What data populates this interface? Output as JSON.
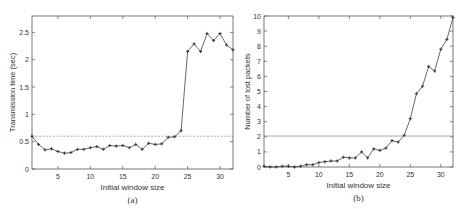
{
  "chart_data": [
    {
      "type": "line",
      "panel_label": "(a)",
      "xlabel": "Initial window size",
      "ylabel": "Transmission time (sec)",
      "xlim": [
        1,
        32
      ],
      "ylim": [
        0,
        2.8
      ],
      "xticks": [
        5,
        10,
        15,
        20,
        25,
        30
      ],
      "yticks": [
        0,
        0.5,
        1,
        1.5,
        2,
        2.5
      ],
      "ytick_labels": [
        "0",
        "0.5",
        "1",
        "1.5",
        "2",
        "2.5"
      ],
      "grid": false,
      "reference_line": {
        "y": 0.6,
        "style": "dashed"
      },
      "x": [
        1,
        2,
        3,
        4,
        5,
        6,
        7,
        8,
        9,
        10,
        11,
        12,
        13,
        14,
        15,
        16,
        17,
        18,
        19,
        20,
        21,
        22,
        23,
        24,
        25,
        26,
        27,
        28,
        29,
        30,
        31,
        32
      ],
      "values": [
        0.6,
        0.45,
        0.35,
        0.37,
        0.32,
        0.29,
        0.3,
        0.36,
        0.36,
        0.39,
        0.41,
        0.36,
        0.43,
        0.42,
        0.43,
        0.39,
        0.45,
        0.36,
        0.47,
        0.45,
        0.46,
        0.58,
        0.59,
        0.7,
        2.15,
        2.29,
        2.15,
        2.48,
        2.35,
        2.48,
        2.27,
        2.18
      ]
    },
    {
      "type": "line",
      "panel_label": "(b)",
      "xlabel": "Initial window size",
      "ylabel": "Number of lost packets",
      "xlim": [
        1,
        32
      ],
      "ylim": [
        0,
        10
      ],
      "xticks": [
        5,
        10,
        15,
        20,
        25,
        30
      ],
      "yticks": [
        0,
        1,
        2,
        3,
        4,
        5,
        6,
        7,
        8,
        9,
        10
      ],
      "ytick_labels": [
        "0",
        "1",
        "2",
        "3",
        "4",
        "5",
        "6",
        "7",
        "8",
        "9",
        "10"
      ],
      "grid": false,
      "reference_line": {
        "y": 2.05,
        "style": "solid"
      },
      "x": [
        1,
        2,
        3,
        4,
        5,
        6,
        7,
        8,
        9,
        10,
        11,
        12,
        13,
        14,
        15,
        16,
        17,
        18,
        19,
        20,
        21,
        22,
        23,
        24,
        25,
        26,
        27,
        28,
        29,
        30,
        31,
        32
      ],
      "values": [
        0.05,
        0.0,
        0.0,
        0.05,
        0.05,
        0.0,
        0.05,
        0.15,
        0.15,
        0.3,
        0.35,
        0.4,
        0.4,
        0.65,
        0.6,
        0.6,
        1.0,
        0.6,
        1.2,
        1.1,
        1.25,
        1.75,
        1.65,
        2.1,
        3.2,
        4.85,
        5.35,
        6.65,
        6.35,
        7.8,
        8.45,
        9.9
      ]
    }
  ]
}
